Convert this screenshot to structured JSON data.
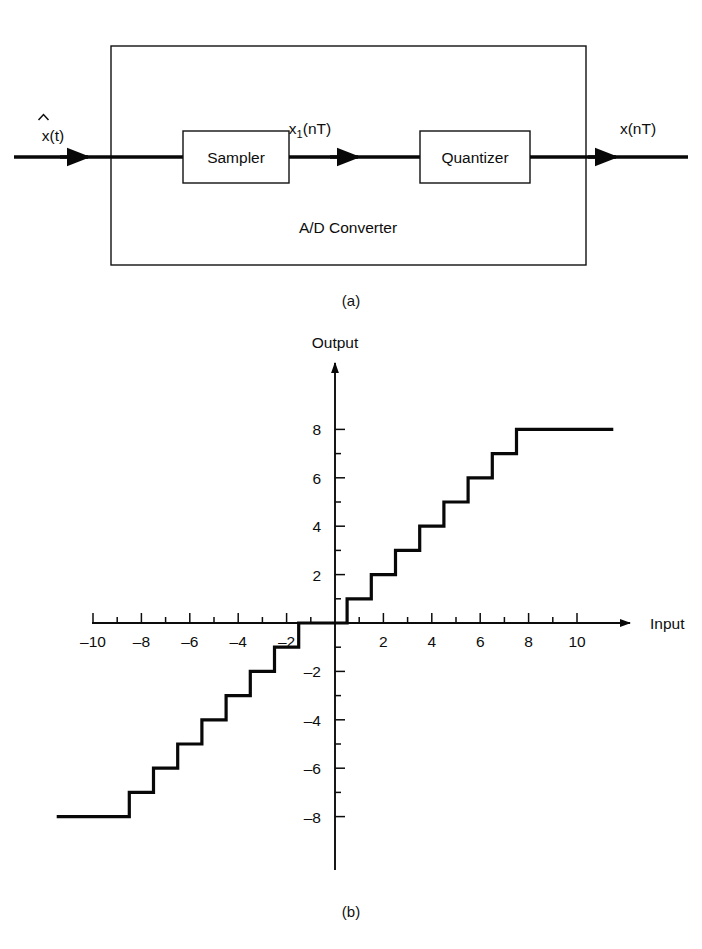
{
  "figure": {
    "panel_a": {
      "caption": "(a)",
      "outer_box_label": "A/D Converter",
      "blocks": [
        {
          "id": "sampler",
          "label": "Sampler"
        },
        {
          "id": "quantizer",
          "label": "Quantizer"
        }
      ],
      "signals": [
        {
          "id": "input",
          "base": "x(t)",
          "accent": "hat",
          "text": "x(t)"
        },
        {
          "id": "intermediate",
          "base": "x",
          "subscript": "1",
          "suffix": "(nT)",
          "text": "x1 (nT)"
        },
        {
          "id": "output",
          "text": "x(nT)"
        }
      ]
    },
    "panel_b": {
      "caption": "(b)",
      "chart_data": {
        "type": "line",
        "title": "",
        "subtitle": "",
        "xlabel": "Input",
        "ylabel": "Output",
        "grid": false,
        "legend": null,
        "xlim": [
          -11.5,
          11.5
        ],
        "ylim": [
          -9.5,
          9.5
        ],
        "xticks_major": [
          -10,
          -8,
          -6,
          -4,
          -2,
          2,
          4,
          6,
          8,
          10
        ],
        "xticks_minor": [
          -9,
          -7,
          -5,
          -3,
          -1,
          1,
          3,
          5,
          7,
          9
        ],
        "xtick_labels": [
          "-10",
          "-8",
          "-6",
          "-4",
          "-2",
          "2",
          "4",
          "6",
          "8",
          "10"
        ],
        "yticks_major": [
          -8,
          -6,
          -4,
          -2,
          2,
          4,
          6,
          8
        ],
        "yticks_minor": [
          -7,
          -5,
          -3,
          -1,
          1,
          3,
          5,
          7
        ],
        "ytick_labels": [
          "-8",
          "-6",
          "-4",
          "-2",
          "2",
          "4",
          "6",
          "8"
        ],
        "description": "Uniform mid-tread quantizer staircase transfer characteristic, saturating at +8 and -8",
        "steps": [
          {
            "x_start": -11.5,
            "x_end": -8.5,
            "y": -8
          },
          {
            "x_start": -8.5,
            "x_end": -7.5,
            "y": -7
          },
          {
            "x_start": -7.5,
            "x_end": -6.5,
            "y": -6
          },
          {
            "x_start": -6.5,
            "x_end": -5.5,
            "y": -5
          },
          {
            "x_start": -5.5,
            "x_end": -4.5,
            "y": -4
          },
          {
            "x_start": -4.5,
            "x_end": -3.5,
            "y": -3
          },
          {
            "x_start": -3.5,
            "x_end": -2.5,
            "y": -2
          },
          {
            "x_start": -2.5,
            "x_end": -1.5,
            "y": -1
          },
          {
            "x_start": -1.5,
            "x_end": -0.5,
            "y": 0
          },
          {
            "x_start": -0.5,
            "x_end": 0.5,
            "y": 0
          },
          {
            "x_start": 0.5,
            "x_end": 1.5,
            "y": 1
          },
          {
            "x_start": 1.5,
            "x_end": 2.5,
            "y": 2
          },
          {
            "x_start": 2.5,
            "x_end": 3.5,
            "y": 3
          },
          {
            "x_start": 3.5,
            "x_end": 4.5,
            "y": 4
          },
          {
            "x_start": 4.5,
            "x_end": 5.5,
            "y": 5
          },
          {
            "x_start": 5.5,
            "x_end": 6.5,
            "y": 6
          },
          {
            "x_start": 6.5,
            "x_end": 7.5,
            "y": 7
          },
          {
            "x_start": 7.5,
            "x_end": 11.5,
            "y": 8
          }
        ]
      }
    }
  }
}
